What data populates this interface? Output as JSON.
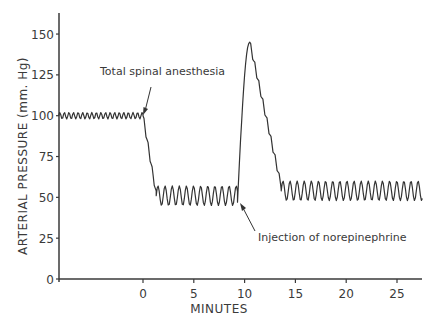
{
  "chart_data": {
    "type": "line",
    "title": "",
    "xlabel": "MINUTES",
    "ylabel": "ARTERIAL PRESSURE (mm. Hg)",
    "xlim": [
      -8.3,
      27.5
    ],
    "ylim": [
      0,
      160
    ],
    "x_ticks": [
      0,
      5,
      10,
      15,
      20,
      25
    ],
    "x_tick_labels": [
      "0",
      "5",
      "10",
      "15",
      "20",
      "25"
    ],
    "y_ticks": [
      0,
      25,
      50,
      75,
      100,
      125,
      150
    ],
    "y_tick_labels": [
      "0",
      "25",
      "50",
      "75",
      "100",
      "125",
      "150"
    ],
    "grid": false,
    "legend": null,
    "series": [
      {
        "name": "Arterial pressure",
        "color": "#333333",
        "segments": [
          {
            "from_min": -8.3,
            "to_min": 0.0,
            "mean": 100,
            "amplitude": 2,
            "period_min": 0.45,
            "description": "baseline ~100 mm Hg"
          },
          {
            "from_min": 0.0,
            "to_min": 1.3,
            "start": 100,
            "end": 52,
            "amplitude": 2,
            "description": "fall after total spinal anesthesia"
          },
          {
            "from_min": 1.3,
            "to_min": 9.3,
            "mean": 51,
            "amplitude": 6,
            "period_min": 0.7,
            "description": "plateau ~50 mm Hg"
          },
          {
            "from_min": 9.3,
            "to_min": 10.5,
            "start": 47,
            "end": 145,
            "amplitude": 0,
            "description": "rise after norepinephrine"
          },
          {
            "from_min": 10.5,
            "to_min": 13.6,
            "start": 145,
            "end": 57,
            "amplitude": 2,
            "description": "decline from peak"
          },
          {
            "from_min": 13.6,
            "to_min": 27.5,
            "mean": 54,
            "amplitude": 6,
            "period_min": 0.7,
            "description": "return to ~55 mm Hg"
          }
        ],
        "key_points": [
          {
            "x": -8.3,
            "y": 100
          },
          {
            "x": 0.0,
            "y": 100
          },
          {
            "x": 1.3,
            "y": 52
          },
          {
            "x": 5.0,
            "y": 51
          },
          {
            "x": 9.3,
            "y": 47
          },
          {
            "x": 10.5,
            "y": 145
          },
          {
            "x": 13.6,
            "y": 57
          },
          {
            "x": 20.0,
            "y": 54
          },
          {
            "x": 27.5,
            "y": 54
          }
        ]
      }
    ],
    "annotations": [
      {
        "text": "Total spinal anesthesia",
        "x": 0.0,
        "y": 100,
        "text_x": -3.5,
        "text_y": 128
      },
      {
        "text": "Injection of  norepinephrine",
        "x": 9.3,
        "y": 47,
        "text_x": 11.5,
        "text_y": 21
      }
    ]
  },
  "labels": {
    "xlabel": "MINUTES",
    "ylabel": "ARTERIAL PRESSURE (mm. Hg)",
    "annotation_spinal": "Total spinal anesthesia",
    "annotation_norepinephrine": "Injection of  norepinephrine"
  }
}
